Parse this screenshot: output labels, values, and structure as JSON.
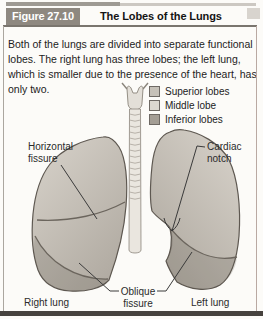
{
  "header": {
    "figure_label": "Figure 27.10",
    "title": "The Lobes of the Lungs"
  },
  "description": "Both of the lungs are divided into separate functional lobes. The right lung has three lobes; the left lung, which is smaller due to the presence of the heart, has only two.",
  "legend": {
    "items": [
      {
        "label": "Superior lobes",
        "color": "#c6c1b8"
      },
      {
        "label": "Middle lobe",
        "color": "#dcd8d0"
      },
      {
        "label": "Inferior lobes",
        "color": "#a49e95"
      }
    ]
  },
  "diagram_labels": {
    "horizontal_fissure": "Horizontal fissure",
    "cardiac_notch": "Cardiac notch",
    "oblique_fissure": "Oblique fissure",
    "right_lung": "Right lung",
    "left_lung": "Left lung"
  },
  "colors": {
    "figure_badge_bg": "#8e8880",
    "lung_light": "#d8d3cb",
    "lung_dark": "#b1aba2",
    "outline": "#5e5851",
    "bottom_rule": "#46423e"
  }
}
